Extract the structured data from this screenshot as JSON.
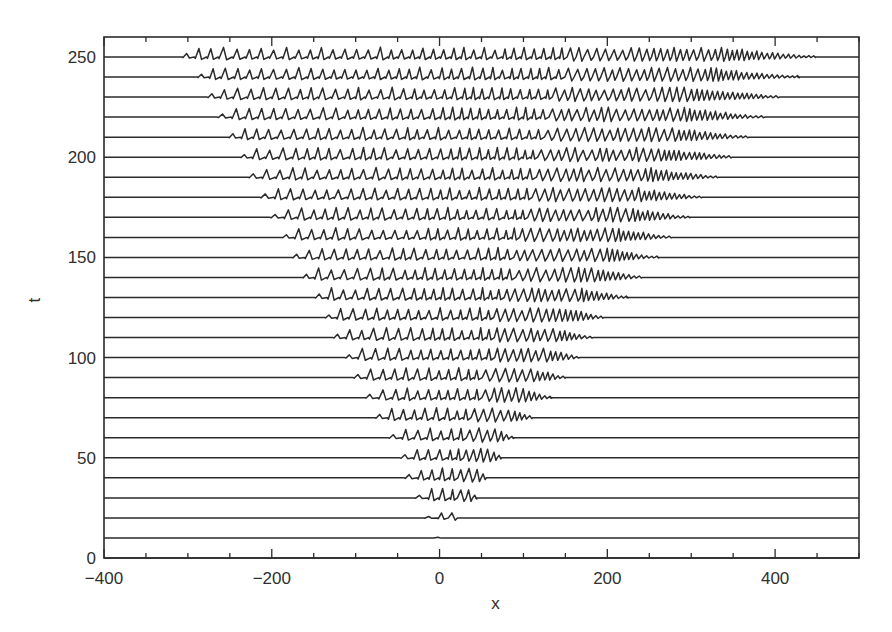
{
  "chart_data": {
    "type": "line",
    "subtype": "stacked waterfall (space-time) plot",
    "title": "",
    "xlabel": "x",
    "ylabel": "t",
    "xlim": [
      -400,
      500
    ],
    "ylim": [
      0,
      260
    ],
    "x_ticks_major": [
      -400,
      -200,
      0,
      200,
      400
    ],
    "x_tick_labels": [
      "-400",
      "-200",
      "0",
      "200",
      "400"
    ],
    "x_ticks_minor_step": 50,
    "y_ticks_major": [
      0,
      50,
      100,
      150,
      200,
      250
    ],
    "y_tick_labels": [
      "0",
      "50",
      "100",
      "150",
      "200",
      "250"
    ],
    "grid": false,
    "legend": null,
    "trace_spacing_t": 10,
    "trace_amplitude_t": 4.5,
    "series": [
      {
        "t": 0,
        "x_start": 0,
        "x_end": 0
      },
      {
        "t": 10,
        "x_start": -8,
        "x_end": 10
      },
      {
        "t": 20,
        "x_start": -19,
        "x_end": 22
      },
      {
        "t": 30,
        "x_start": -30,
        "x_end": 43
      },
      {
        "t": 40,
        "x_start": -42,
        "x_end": 58
      },
      {
        "t": 50,
        "x_start": -47,
        "x_end": 74
      },
      {
        "t": 60,
        "x_start": -61,
        "x_end": 87
      },
      {
        "t": 70,
        "x_start": -77,
        "x_end": 111
      },
      {
        "t": 80,
        "x_start": -89,
        "x_end": 132
      },
      {
        "t": 90,
        "x_start": -103,
        "x_end": 149
      },
      {
        "t": 100,
        "x_start": -113,
        "x_end": 167
      },
      {
        "t": 110,
        "x_start": -127,
        "x_end": 183
      },
      {
        "t": 120,
        "x_start": -137,
        "x_end": 197
      },
      {
        "t": 130,
        "x_start": -149,
        "x_end": 223
      },
      {
        "t": 140,
        "x_start": -164,
        "x_end": 242
      },
      {
        "t": 150,
        "x_start": -176,
        "x_end": 260
      },
      {
        "t": 160,
        "x_start": -188,
        "x_end": 278
      },
      {
        "t": 170,
        "x_start": -202,
        "x_end": 298
      },
      {
        "t": 180,
        "x_start": -214,
        "x_end": 314
      },
      {
        "t": 190,
        "x_start": -228,
        "x_end": 334
      },
      {
        "t": 200,
        "x_start": -238,
        "x_end": 350
      },
      {
        "t": 210,
        "x_start": -252,
        "x_end": 370
      },
      {
        "t": 220,
        "x_start": -265,
        "x_end": 388
      },
      {
        "t": 230,
        "x_start": -277,
        "x_end": 406
      },
      {
        "t": 240,
        "x_start": -289,
        "x_end": 427
      },
      {
        "t": 250,
        "x_start": -307,
        "x_end": 448
      }
    ]
  },
  "layout": {
    "frame": {
      "left": 104,
      "top": 37,
      "right": 859,
      "bottom": 558
    },
    "ink_color": "#2b2b2b"
  }
}
